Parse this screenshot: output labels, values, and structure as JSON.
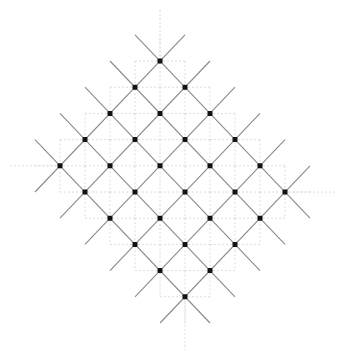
{
  "diagram": {
    "type": "rotated-lattice",
    "rows": 5,
    "cols": 6,
    "origin": {
      "x": 160,
      "y": 61
    },
    "step": {
      "x": 25,
      "y": 26.2
    },
    "colors": {
      "node": "#111111",
      "edge": "#8a8a8a",
      "grid": "#dcdcdc",
      "background": "#ffffff"
    },
    "node_size": 5,
    "edge_extension": 1.0
  }
}
